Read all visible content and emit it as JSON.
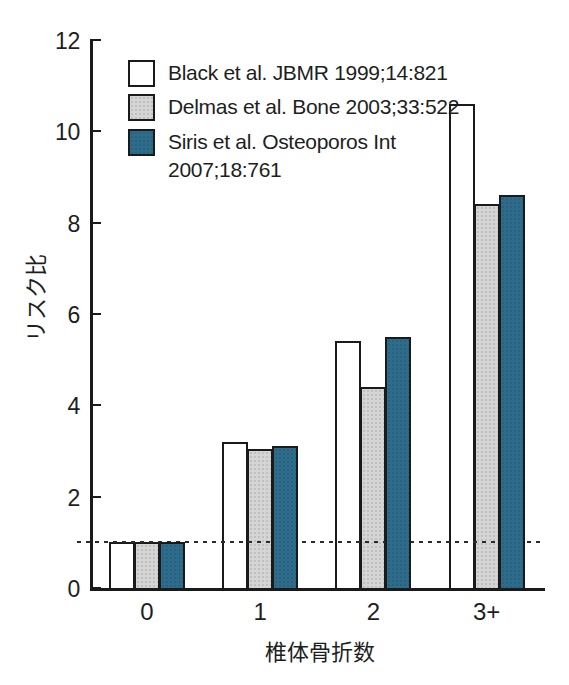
{
  "figure": {
    "background": "#ffffff",
    "axis_color": "#1a1a1a",
    "text_color": "#1e1e1e"
  },
  "chart_data": {
    "type": "bar",
    "title": "",
    "xlabel": "椎体骨折数",
    "ylabel": "リスク比",
    "categories": [
      "0",
      "1",
      "2",
      "3+"
    ],
    "series": [
      {
        "name": "Black et al. JBMR 1999;14:821",
        "legend_lines": [
          "Black et al. JBMR 1999;14:821"
        ],
        "color": "#ffffff",
        "textured": false,
        "values": [
          1.0,
          3.2,
          5.4,
          10.6
        ]
      },
      {
        "name": "Delmas et al. Bone 2003;33:522",
        "legend_lines": [
          "Delmas et al. Bone 2003;33:522"
        ],
        "color": "#d5d5d5",
        "textured": true,
        "values": [
          1.0,
          3.05,
          4.4,
          8.4
        ]
      },
      {
        "name": "Siris et al. Osteoporos Int 2007;18:761",
        "legend_lines": [
          "Siris et al. Osteoporos Int",
          "2007;18:761"
        ],
        "color": "#2e6c8c",
        "textured": true,
        "values": [
          1.0,
          3.1,
          5.5,
          8.6
        ]
      }
    ],
    "ylim": [
      0,
      12
    ],
    "yticks": [
      0,
      2,
      4,
      6,
      8,
      10,
      12
    ],
    "reference_line": {
      "y": 1,
      "style": "dashed"
    },
    "legend_position": "upper-left-inside",
    "grid": false
  }
}
